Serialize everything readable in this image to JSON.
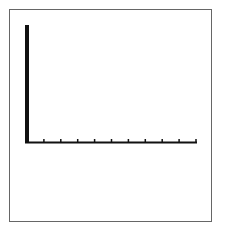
{
  "chart_data": {
    "type": "line",
    "title": "",
    "xlabel": "",
    "ylabel": "",
    "x_tick_count": 10,
    "x_tick_labels": [],
    "y_tick_labels": [],
    "series": [],
    "grid": false,
    "legend": null,
    "colors": {
      "axis": "#111111",
      "frame": "#666666",
      "background": "#ffffff"
    }
  }
}
